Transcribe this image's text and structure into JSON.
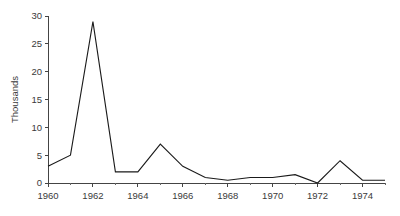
{
  "chart_data": {
    "type": "line",
    "title": "",
    "subtitle": "",
    "xlabel": "",
    "ylabel": "Thousands",
    "x": [
      1960,
      1961,
      1962,
      1963,
      1964,
      1965,
      1966,
      1967,
      1968,
      1969,
      1970,
      1971,
      1972,
      1973,
      1974,
      1975
    ],
    "values": [
      3,
      5,
      29,
      2,
      2,
      7,
      3,
      1,
      0.5,
      1,
      1,
      1.5,
      0,
      4,
      0.5,
      0.5
    ],
    "series": [
      {
        "name": "",
        "values": [
          3,
          5,
          29,
          2,
          2,
          7,
          3,
          1,
          0.5,
          1,
          1,
          1.5,
          0,
          4,
          0.5,
          0.5
        ]
      }
    ],
    "xlim": [
      1960,
      1975
    ],
    "ylim": [
      0,
      30
    ],
    "ytick_values": [
      0,
      5,
      10,
      15,
      20,
      25,
      30
    ],
    "ytick_labels": [
      "0",
      "5",
      "10",
      "15",
      "20",
      "25",
      "30"
    ],
    "xtick_values": [
      1960,
      1962,
      1964,
      1966,
      1968,
      1970,
      1972,
      1974
    ],
    "xtick_labels": [
      "1960",
      "1962",
      "1964",
      "1966",
      "1968",
      "1970",
      "1972",
      "1974"
    ],
    "xminor_tick_values": [
      1961,
      1963,
      1965,
      1967,
      1969,
      1971,
      1973,
      1975
    ],
    "grid": false,
    "legend": null,
    "legend_position": "none",
    "annotations": [],
    "line_color": "#1a1a1a",
    "axis_color": "#444444",
    "background_color": "#ffffff",
    "text_color": "#3a3a3a"
  }
}
